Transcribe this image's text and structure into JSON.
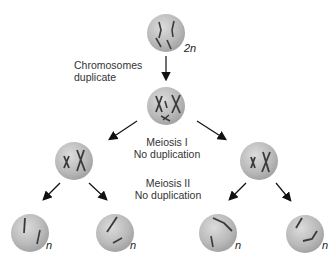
{
  "diagram": {
    "stages": {
      "top_cell": {
        "ploidy": "2n"
      },
      "step1": {
        "line1": "Chromosomes",
        "line2": "duplicate"
      },
      "step2": {
        "line1": "Meiosis I",
        "line2": "No duplication"
      },
      "step3": {
        "line1": "Meiosis II",
        "line2": "No duplication"
      },
      "bottom_cells": [
        {
          "ploidy": "n"
        },
        {
          "ploidy": "n"
        },
        {
          "ploidy": "n"
        },
        {
          "ploidy": "n"
        }
      ]
    },
    "colors": {
      "cell": "#b8b8b8",
      "chromosome": "#3a3a3a",
      "arrow": "#111111"
    }
  }
}
